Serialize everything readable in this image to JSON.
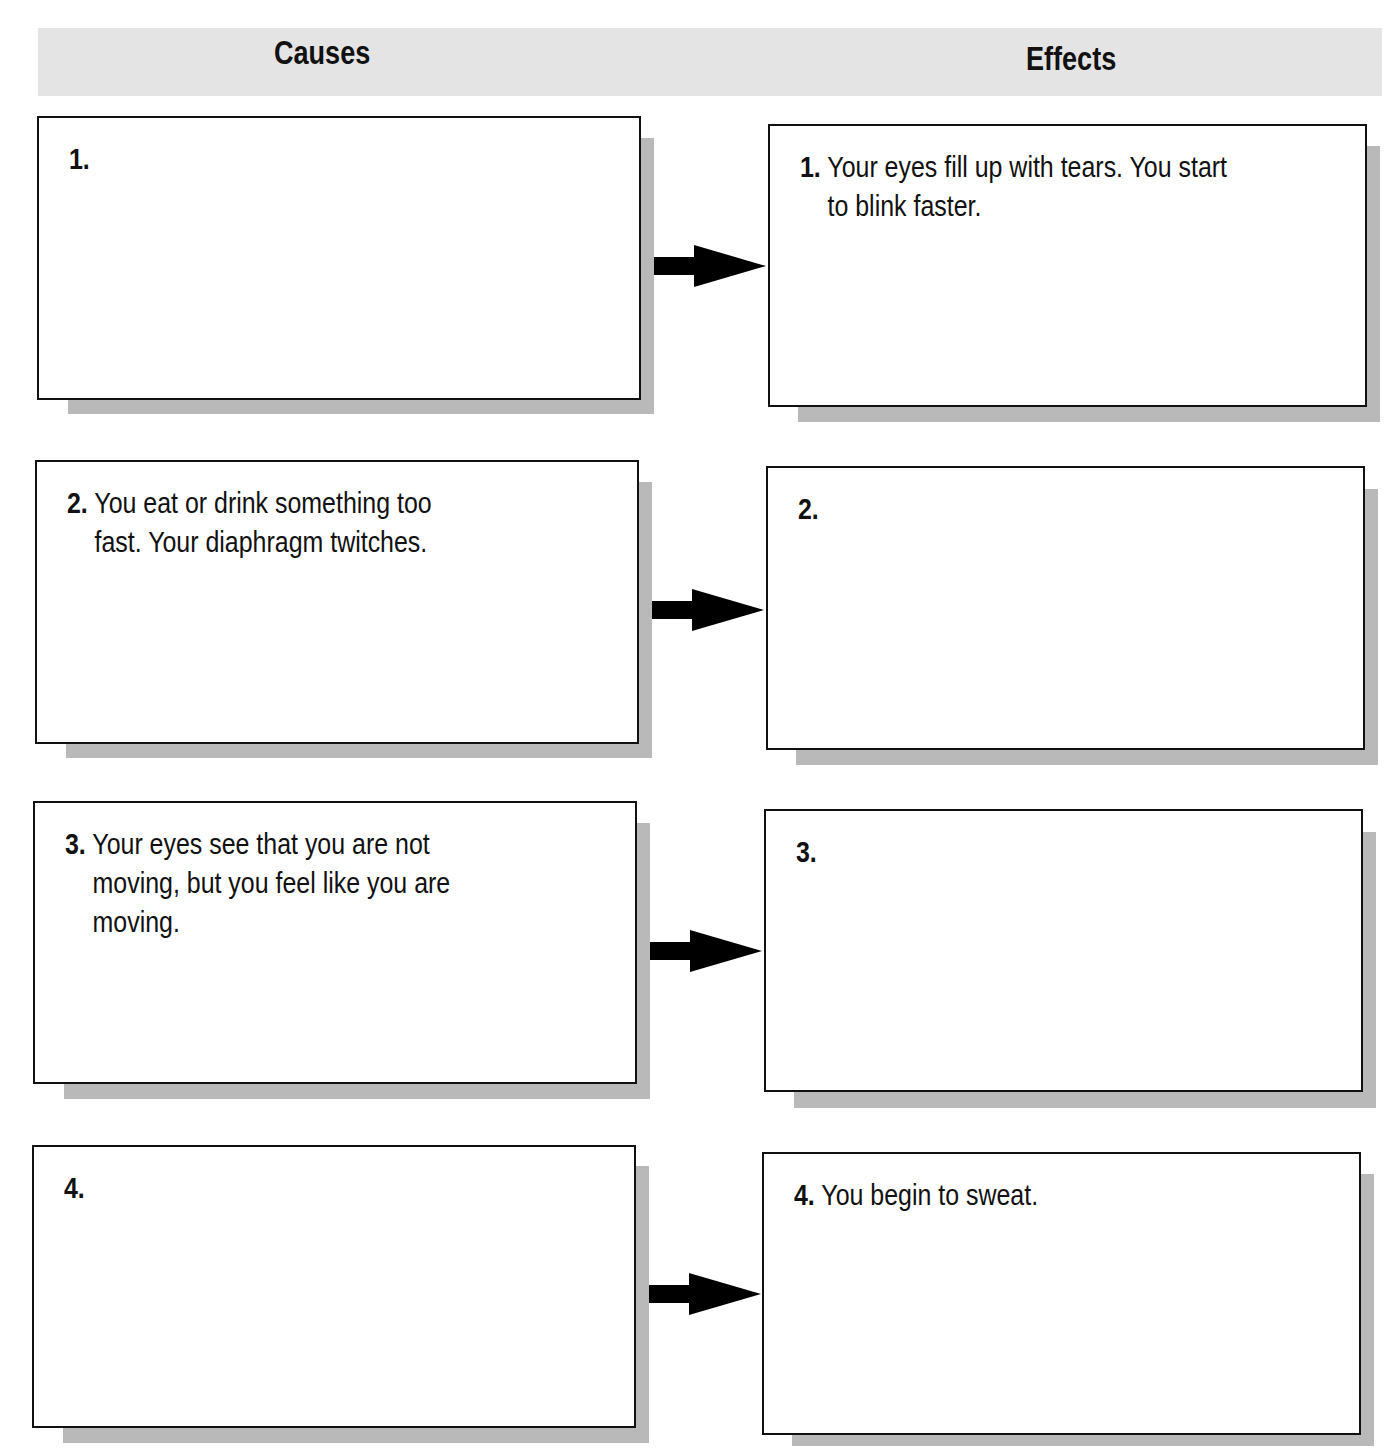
{
  "header": {
    "causes_title": "Causes",
    "effects_title": "Effects",
    "band_color": "#e4e4e4"
  },
  "rows": [
    {
      "cause": {
        "number": "1.",
        "lines": [
          "",
          ""
        ]
      },
      "effect": {
        "number": "1.",
        "lines": [
          "Your eyes fill up with tears. You start",
          "to blink faster."
        ]
      }
    },
    {
      "cause": {
        "number": "2.",
        "lines": [
          "You eat or drink something too",
          "fast. Your diaphragm twitches."
        ]
      },
      "effect": {
        "number": "2.",
        "lines": [
          "",
          ""
        ]
      }
    },
    {
      "cause": {
        "number": "3.",
        "lines": [
          "Your eyes see that you are not",
          "moving, but you feel like you are",
          "moving."
        ]
      },
      "effect": {
        "number": "3.",
        "lines": [
          "",
          ""
        ]
      }
    },
    {
      "cause": {
        "number": "4.",
        "lines": [
          "",
          ""
        ]
      },
      "effect": {
        "number": "4.",
        "lines": [
          "You begin to sweat.",
          ""
        ]
      }
    }
  ],
  "colors": {
    "shadow": "#b9b9b9",
    "border": "#111111",
    "arrow": "#000000"
  }
}
